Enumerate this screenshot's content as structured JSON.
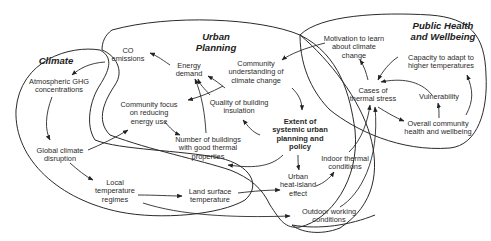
{
  "diagram": {
    "type": "causal-loop",
    "regions": [
      {
        "id": "climate",
        "title": "Climate"
      },
      {
        "id": "urban",
        "title_line1": "Urban",
        "title_line2": "Planning"
      },
      {
        "id": "health",
        "title_line1": "Public Health",
        "title_line2": "and Wellbeing"
      }
    ],
    "nodes": {
      "co": {
        "l1": "CO",
        "l2": "emissions"
      },
      "ghg": {
        "l1": "Atmospheric GHG",
        "l2": "concentrations"
      },
      "gcd": {
        "l1": "Global climate",
        "l2": "disruption"
      },
      "ltr": {
        "l1": "Local",
        "l2": "temperature",
        "l3": "regimes"
      },
      "lst": {
        "l1": "Land surface",
        "l2": "temperature"
      },
      "energy": {
        "l1": "Energy",
        "l2": "demand"
      },
      "cfocus": {
        "l1": "Community focus",
        "l2": "on reducing",
        "l3": "energy use"
      },
      "cund": {
        "l1": "Community",
        "l2": "understanding of",
        "l3": "climate change"
      },
      "qbi": {
        "l1": "Quality of building",
        "l2": "insulation"
      },
      "nbuild": {
        "l1": "Number of buildings",
        "l2": "with good thermal",
        "l3": "properties"
      },
      "extent": {
        "l1": "Extent of",
        "l2": "systemic urban",
        "l3": "planning and",
        "l4": "policy"
      },
      "uhi": {
        "l1": "Urban",
        "l2": "heat-island",
        "l3": "effect"
      },
      "indoor": {
        "l1": "Indoor thermal",
        "l2": "conditions"
      },
      "outdoor": {
        "l1": "Outdoor working",
        "l2": "conditions"
      },
      "motiv": {
        "l1": "Motivation to learn",
        "l2": "about climate",
        "l3": "change"
      },
      "cases": {
        "l1": "Cases of",
        "l2": "thermal stress"
      },
      "capacity": {
        "l1": "Capacity to adapt to",
        "l2": "higher temperatures"
      },
      "vuln": {
        "l1": "Vulnerability"
      },
      "overall": {
        "l1": "Overall community",
        "l2": "health and wellbeing"
      }
    },
    "edges": [
      [
        "CO emissions",
        "Atmospheric GHG concentrations"
      ],
      [
        "Atmospheric GHG concentrations",
        "Global climate disruption"
      ],
      [
        "Global climate disruption",
        "Local temperature regimes"
      ],
      [
        "Global climate disruption",
        "Community focus on reducing energy use"
      ],
      [
        "Local temperature regimes",
        "Land surface temperature"
      ],
      [
        "Local temperature regimes",
        "Outdoor working conditions"
      ],
      [
        "Land surface temperature",
        "Urban heat-island effect"
      ],
      [
        "Energy demand",
        "CO emissions"
      ],
      [
        "Community focus on reducing energy use",
        "Energy demand"
      ],
      [
        "Community focus on reducing energy use",
        "Number of buildings with good thermal properties"
      ],
      [
        "Quality of building insulation",
        "Energy demand"
      ],
      [
        "Number of buildings with good thermal properties",
        "Energy demand"
      ],
      [
        "Community understanding of climate change",
        "Community focus on reducing energy use"
      ],
      [
        "Community understanding of climate change",
        "Extent of systemic urban planning and policy"
      ],
      [
        "Extent of systemic urban planning and policy",
        "Quality of building insulation"
      ],
      [
        "Extent of systemic urban planning and policy",
        "Number of buildings with good thermal properties"
      ],
      [
        "Extent of systemic urban planning and policy",
        "Urban heat-island effect"
      ],
      [
        "Urban heat-island effect",
        "Indoor thermal conditions"
      ],
      [
        "Indoor thermal conditions",
        "Cases of thermal stress"
      ],
      [
        "Outdoor working conditions",
        "Cases of thermal stress"
      ],
      [
        "Motivation to learn about climate change",
        "Community understanding of climate change"
      ],
      [
        "Cases of thermal stress",
        "Motivation to learn about climate change"
      ],
      [
        "Cases of thermal stress",
        "Overall community health and wellbeing"
      ],
      [
        "Capacity to adapt to higher temperatures",
        "Cases of thermal stress"
      ],
      [
        "Vulnerability",
        "Cases of thermal stress"
      ],
      [
        "Overall community health and wellbeing",
        "Vulnerability"
      ],
      [
        "Overall community health and wellbeing",
        "Capacity to adapt to higher temperatures"
      ]
    ]
  }
}
